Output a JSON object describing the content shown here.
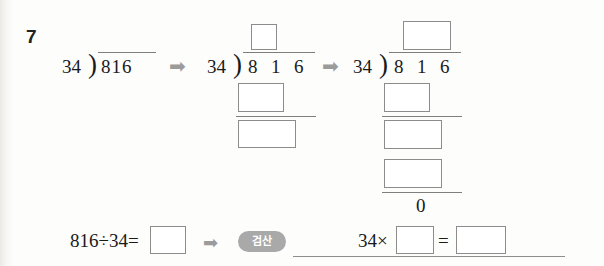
{
  "worksheet": {
    "problem_number": "7",
    "arrow_glyph": "➡",
    "zero_remainder": "0"
  },
  "step1": {
    "name": "initial-division",
    "divisor": "34",
    "bracket": ")",
    "dividend": "816"
  },
  "step2": {
    "name": "partial-division",
    "divisor": "34",
    "bracket": ")",
    "dividend_digits": [
      "8",
      "1",
      "6"
    ],
    "quotient_box_placeholder": "",
    "subtract_box_placeholder": "",
    "remainder_box_placeholder": ""
  },
  "step3": {
    "name": "complete-division",
    "divisor": "34",
    "bracket": ")",
    "dividend_digits": [
      "8",
      "1",
      "6"
    ],
    "quotient_box_placeholder": "",
    "first_product_box_placeholder": "",
    "bring_down_box_placeholder": "",
    "second_product_box_placeholder": "",
    "remainder": "0"
  },
  "answer_row": {
    "expression": "816÷34=",
    "answer_box_placeholder": "",
    "verify_label": "검산",
    "check_lhs": "34×",
    "check_factor_box_placeholder": "",
    "check_equals": "=",
    "check_result_box_placeholder": ""
  },
  "colors": {
    "ink": "#1a1a1a",
    "box_border": "#8c8c8c",
    "rule": "#7e7e7e",
    "arrow": "#9b9b9b",
    "pill_bg": "#a9a9a9",
    "pill_text": "#ffffff",
    "paper": "#fdfdfc"
  }
}
